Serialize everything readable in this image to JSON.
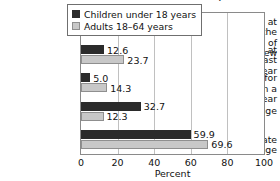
{
  "chart_data": {
    "type": "bar",
    "orientation": "horizontal",
    "title": "...insurance in the United States, 2007",
    "xlabel": "Percent",
    "ylabel": "",
    "xlim": [
      0,
      100
    ],
    "xticks": [
      0,
      20,
      40,
      60,
      80,
      100
    ],
    "grid": "vertical",
    "legend_position": "top-right-inside",
    "categories": [
      "Uninsured at the time of interview",
      "Uninsured at least part of the year",
      "Uninsured for more than a year",
      "Public coverage",
      "Private coverage"
    ],
    "category_lines": [
      [
        "Uninsured at the",
        "time of interview"
      ],
      [
        "Uninsured at least",
        "part of the year"
      ],
      [
        "Uninsured for",
        "more than a year"
      ],
      [
        "Public coverage"
      ],
      [
        "Private coverage"
      ]
    ],
    "series": [
      {
        "name": "Children under 18 years",
        "color": "#2b2b2b",
        "values": [
          8.9,
          12.6,
          5.0,
          32.7,
          59.9
        ],
        "labels": [
          "8.9",
          "12.6",
          "5.0",
          "32.7",
          "59.9"
        ]
      },
      {
        "name": "Adults 18–64 years",
        "color": "#c8c8c8",
        "values": [
          19.4,
          23.7,
          14.3,
          12.3,
          69.6
        ],
        "labels": [
          "19.4",
          "23.7",
          "14.3",
          "12.3",
          "69.6"
        ]
      }
    ]
  },
  "legend": {
    "items": [
      {
        "label": "Children under 18 years",
        "swatch": "dark"
      },
      {
        "label": "Adults 18–64 years",
        "swatch": "light"
      }
    ]
  },
  "axis": {
    "tick_labels": [
      "0",
      "20",
      "40",
      "60",
      "80",
      "100"
    ],
    "x_title": "Percent"
  }
}
